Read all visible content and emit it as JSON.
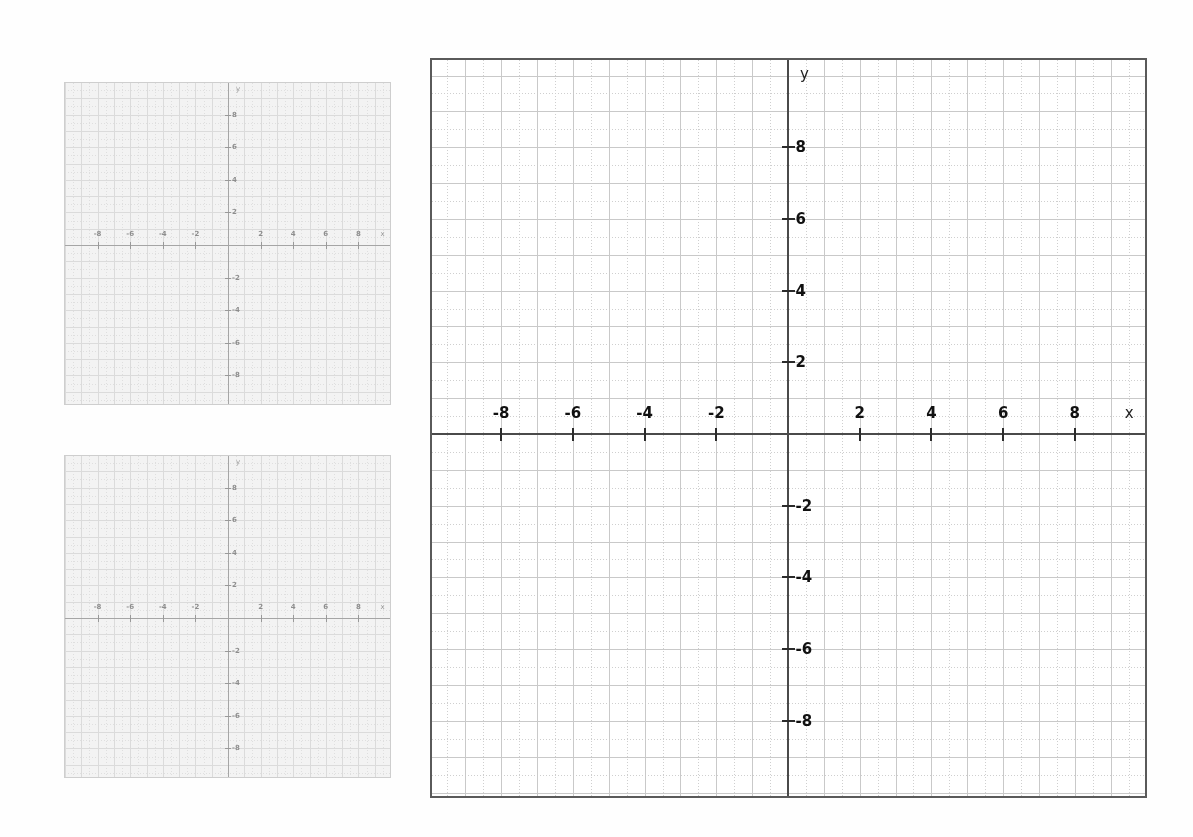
{
  "document": {
    "kind": "coordinate-grid-worksheet",
    "background_color": "#ffffff",
    "panel_count": 3
  },
  "chart_data": {
    "type": "scatter",
    "title": "",
    "subtitle": "",
    "xlabel": "x",
    "ylabel": "y",
    "grid": true,
    "legend_position": "none",
    "series": [
      {
        "name": "no data plotted",
        "x": [],
        "y": []
      }
    ],
    "panels": [
      {
        "id": "small-top",
        "role": "answer-grid-1",
        "xlim": [
          -9.5,
          9.5
        ],
        "ylim": [
          -9.5,
          9.5
        ],
        "xticks": [
          -8,
          -6,
          -4,
          -2,
          2,
          4,
          6,
          8
        ],
        "yticks": [
          -8,
          -6,
          -4,
          -2,
          2,
          4,
          6,
          8
        ],
        "xtick_labels": [
          "-8",
          "-6",
          "-4",
          "-2",
          "2",
          "4",
          "6",
          "8"
        ],
        "ytick_labels": [
          "-8",
          "-6",
          "-4",
          "-2",
          "2",
          "4",
          "6",
          "8"
        ],
        "x_axis_name": "x",
        "y_axis_name": "y",
        "minor_step": 0.5,
        "major_step": 1,
        "data_points": []
      },
      {
        "id": "small-bottom",
        "role": "answer-grid-2",
        "xlim": [
          -9.5,
          9.5
        ],
        "ylim": [
          -9.5,
          9.5
        ],
        "xticks": [
          -8,
          -6,
          -4,
          -2,
          2,
          4,
          6,
          8
        ],
        "yticks": [
          -8,
          -6,
          -4,
          -2,
          2,
          4,
          6,
          8
        ],
        "xtick_labels": [
          "-8",
          "-6",
          "-4",
          "-2",
          "2",
          "4",
          "6",
          "8"
        ],
        "ytick_labels": [
          "-8",
          "-6",
          "-4",
          "-2",
          "2",
          "4",
          "6",
          "8"
        ],
        "x_axis_name": "x",
        "y_axis_name": "y",
        "minor_step": 0.5,
        "major_step": 1,
        "data_points": []
      },
      {
        "id": "main",
        "role": "primary-graph",
        "xlim": [
          -9.8,
          10,
          0
        ],
        "ylim": [
          -10.2,
          10.2
        ],
        "xticks": [
          -8,
          -6,
          -4,
          -2,
          2,
          4,
          6,
          8
        ],
        "yticks": [
          -8,
          -6,
          -4,
          -2,
          2,
          4,
          6,
          8
        ],
        "xtick_labels": [
          "-8",
          "-6",
          "-4",
          "-2",
          "2",
          "4",
          "6",
          "8"
        ],
        "ytick_labels": [
          "-8",
          "-6",
          "-4",
          "-2",
          "2",
          "4",
          "6",
          "8"
        ],
        "x_axis_name": "x",
        "y_axis_name": "y",
        "minor_step": 0.5,
        "major_step": 1,
        "data_points": []
      }
    ]
  },
  "axis_names": {
    "x": "x",
    "y": "y"
  },
  "tick_labels": {
    "x_negative": [
      "-8",
      "-6",
      "-4",
      "-2"
    ],
    "x_positive": [
      "2",
      "4",
      "6",
      "8"
    ],
    "y_positive": [
      "8",
      "6",
      "4",
      "2"
    ],
    "y_negative": [
      "-2",
      "-4",
      "-6",
      "-8"
    ]
  },
  "colors": {
    "page_background": "#ffffff",
    "plot_background": "#ffffff",
    "border": "#5a5a5a",
    "axis": "#4a4a4a",
    "major_grid": "#c9c9c9",
    "minor_grid": "#cfcfcf",
    "tick": "#2b2b2b",
    "label_text": "#111111",
    "faded_border": "#b9b9b9",
    "faded_axis": "#6b6b6b"
  },
  "geometry": {
    "main": {
      "left": 430,
      "top": 58,
      "width": 717,
      "height": 740,
      "origin_x": 356,
      "origin_y": 374,
      "unit_px": 35.85,
      "tick_len_x": 13,
      "tick_len_y": 13
    },
    "small": {
      "width": 327,
      "height": 323,
      "origin_x": 163,
      "origin_y": 162,
      "unit_px": 16.3,
      "tick_len_x": 7,
      "tick_len_y": 6
    },
    "small_top": {
      "left": 64,
      "top": 82
    },
    "small_bottom": {
      "left": 64,
      "top": 455
    }
  }
}
